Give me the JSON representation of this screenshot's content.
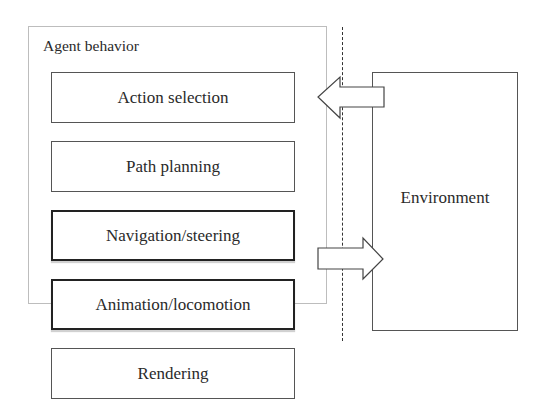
{
  "diagram": {
    "container": {
      "label": "Agent behavior"
    },
    "layers": [
      {
        "label": "Action selection",
        "emphasis": false,
        "inside_agent_behavior": true
      },
      {
        "label": "Path planning",
        "emphasis": false,
        "inside_agent_behavior": true
      },
      {
        "label": "Navigation/steering",
        "emphasis": true,
        "inside_agent_behavior": true
      },
      {
        "label": "Animation/locomotion",
        "emphasis": true,
        "inside_agent_behavior": "partial"
      },
      {
        "label": "Rendering",
        "emphasis": false,
        "inside_agent_behavior": false
      }
    ],
    "environment": {
      "label": "Environment"
    },
    "arrows": [
      {
        "name": "environment-to-action-selection",
        "direction": "left",
        "from": "Environment",
        "to": "Action selection"
      },
      {
        "name": "navigation-to-environment",
        "direction": "right",
        "from": "Navigation/steering",
        "to": "Environment"
      }
    ],
    "separator": {
      "style": "dashed",
      "orientation": "vertical"
    },
    "colors": {
      "stroke": "#222222",
      "container_stroke": "#bdbdbd",
      "background": "#ffffff"
    }
  }
}
